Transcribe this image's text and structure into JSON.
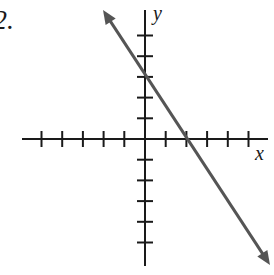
{
  "problem": {
    "number_label": "2."
  },
  "axes": {
    "x_label": "x",
    "y_label": "y",
    "origin_px": [
      145,
      139
    ],
    "tick_spacing_px": 20.7,
    "x_ticks_left": 5,
    "x_ticks_right": 5,
    "y_ticks_up": 5,
    "y_ticks_down": 5,
    "x_axis_extent_px": [
      22,
      268
    ],
    "y_axis_extent_px": [
      10,
      266
    ],
    "axis_color": "#1a1a1a"
  },
  "line": {
    "color": "#555555",
    "y_intercept": 3,
    "x_intercept": 2,
    "slope": -1.5,
    "equation": "y = -3/2 x + 3",
    "start_px": [
      103,
      10
    ],
    "end_px": [
      270,
      265
    ],
    "arrows": "both"
  },
  "chart_data": {
    "type": "line",
    "title": "",
    "xlabel": "x",
    "ylabel": "y",
    "xlim": [
      -6,
      6
    ],
    "ylim": [
      -6,
      6
    ],
    "grid": false,
    "x_ticks": [
      -5,
      -4,
      -3,
      -2,
      -1,
      1,
      2,
      3,
      4,
      5
    ],
    "y_ticks": [
      -5,
      -4,
      -3,
      -2,
      -1,
      1,
      2,
      3,
      4,
      5
    ],
    "series": [
      {
        "name": "line",
        "x": [
          -2,
          0,
          2,
          4,
          6
        ],
        "y": [
          6,
          3,
          0,
          -3,
          -6
        ],
        "arrows": "both"
      }
    ],
    "annotations": [
      "2."
    ]
  }
}
